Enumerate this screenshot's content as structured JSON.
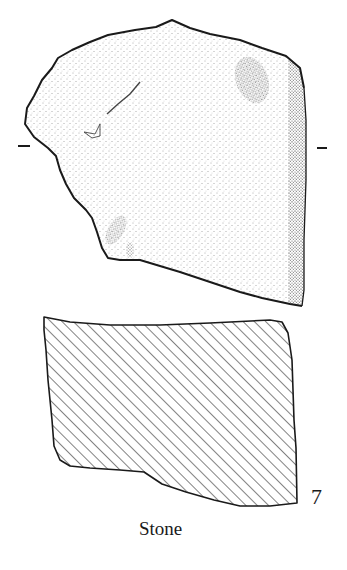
{
  "figure": {
    "number": "7",
    "caption": "Stone",
    "views": [
      {
        "name": "plan-view",
        "fill": "stipple"
      },
      {
        "name": "section-view",
        "fill": "diagonal-hatch"
      }
    ],
    "section_marks": [
      "–",
      "–"
    ],
    "colors": {
      "ink": "#1a1a1a",
      "paper": "#ffffff"
    }
  }
}
